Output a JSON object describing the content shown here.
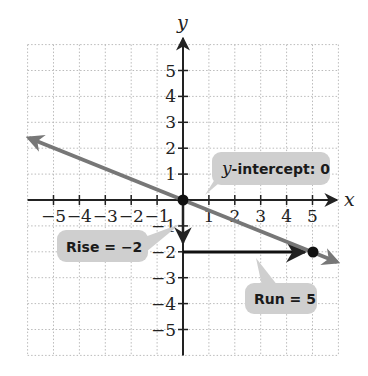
{
  "chart_data": {
    "type": "line",
    "title": "",
    "xlabel": "x",
    "ylabel": "y",
    "xlim": [
      -6,
      6
    ],
    "ylim": [
      -6,
      6
    ],
    "grid": true,
    "x_ticks": [
      -5,
      -4,
      -3,
      -2,
      -1,
      1,
      2,
      3,
      4,
      5
    ],
    "y_ticks": [
      -5,
      -4,
      -3,
      -2,
      -1,
      1,
      2,
      3,
      4,
      5
    ],
    "x_tick_labels": [
      "−5",
      "−4",
      "−3",
      "−2",
      "−1",
      "1",
      "2",
      "3",
      "4",
      "5"
    ],
    "y_tick_labels": [
      "−5",
      "−4",
      "−3",
      "−2",
      "−1",
      "1",
      "2",
      "3",
      "4",
      "5"
    ],
    "series": [
      {
        "name": "line",
        "equation": "y = -2/5 x",
        "slope": -0.4,
        "intercept": 0,
        "x": [
          -6,
          6
        ],
        "y": [
          2.4,
          -2.4
        ],
        "color": "#777777",
        "arrows": "both"
      }
    ],
    "points": [
      {
        "x": 0,
        "y": 0,
        "label": "y-intercept"
      },
      {
        "x": 5,
        "y": -2
      }
    ],
    "annotations": [
      {
        "text_prefix": "y",
        "text_rest": "-intercept: 0",
        "points_to": [
          0,
          0
        ]
      },
      {
        "text": "Rise = −2",
        "points_to": [
          0,
          -1
        ]
      },
      {
        "text": "Run = 5",
        "points_to": [
          3.3,
          -2
        ]
      }
    ],
    "rise_arrow": {
      "from": [
        0,
        0
      ],
      "to": [
        0,
        -2
      ],
      "value": -2
    },
    "run_arrow": {
      "from": [
        0,
        -2
      ],
      "to": [
        5,
        -2
      ],
      "value": 5
    }
  },
  "labels": {
    "x_axis": "x",
    "y_axis": "y",
    "callout_intercept_italic": "y",
    "callout_intercept_rest": "-intercept: 0",
    "callout_rise": "Rise = −2",
    "callout_run": "Run = 5"
  },
  "colors": {
    "line": "#777777",
    "axes": "#222222",
    "grid": "#bbbbbb",
    "callout_fill": "#cfcfcf",
    "point": "#111111"
  }
}
